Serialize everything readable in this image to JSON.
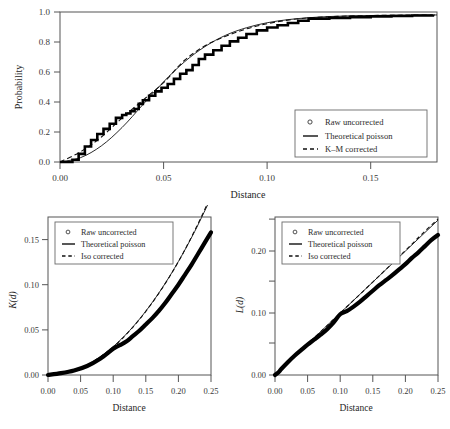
{
  "figure": {
    "background": "#ffffff",
    "ink": "#1a1a1a",
    "panel_border_color": "#555555"
  },
  "legend_common": {
    "raw_label": "Raw uncorrected",
    "theoretical_label": "Theoretical poisson",
    "km_label": "K–M corrected",
    "iso_label": "Iso corrected",
    "marker_raw": "circle-open-icon",
    "marker_theoretical": "solid-line-icon",
    "marker_corrected": "dashed-line-icon"
  },
  "panels": {
    "top": {
      "name": "empty-space-function-panel",
      "xlabel": "Distance",
      "ylabel": "Probability",
      "xticks": [
        "0.00",
        "0.05",
        "0.10",
        "0.15"
      ],
      "yticks": [
        "0.0",
        "0.2",
        "0.4",
        "0.6",
        "0.8",
        "1.0"
      ],
      "legend": [
        "Raw uncorrected",
        "Theoretical poisson",
        "K–M corrected"
      ]
    },
    "bottom_left": {
      "name": "ripley-k-panel",
      "xlabel": "Distance",
      "ylabel": "K(d)",
      "ylabel_fn": "K",
      "ylabel_arg": "d",
      "xticks": [
        "0.00",
        "0.05",
        "0.10",
        "0.15",
        "0.20",
        "0.25"
      ],
      "yticks": [
        "0.00",
        "0.05",
        "0.10",
        "0.15"
      ],
      "legend": [
        "Raw uncorrected",
        "Theoretical poisson",
        "Iso corrected"
      ]
    },
    "bottom_right": {
      "name": "besag-l-panel",
      "xlabel": "Distance",
      "ylabel": "L(d)",
      "ylabel_fn": "L",
      "ylabel_arg": "d",
      "xticks": [
        "0.00",
        "0.05",
        "0.10",
        "0.15",
        "0.20",
        "0.25"
      ],
      "yticks": [
        "0.00",
        "0.10",
        "0.20"
      ],
      "legend": [
        "Raw uncorrected",
        "Theoretical poisson",
        "Iso corrected"
      ]
    }
  },
  "chart_data": [
    {
      "type": "line",
      "id": "top-cdf",
      "title": "",
      "xlabel": "Distance",
      "ylabel": "Probability",
      "xlim": [
        0.0,
        0.182
      ],
      "ylim": [
        0.0,
        1.02
      ],
      "grid": false,
      "legend_position": "bottom-right",
      "xticks": [
        0.0,
        0.05,
        0.1,
        0.15
      ],
      "yticks": [
        0.0,
        0.2,
        0.4,
        0.6,
        0.8,
        1.0
      ],
      "series": [
        {
          "name": "Raw uncorrected",
          "style": "step",
          "x": [
            0.0,
            0.004,
            0.006,
            0.009,
            0.012,
            0.015,
            0.018,
            0.021,
            0.024,
            0.027,
            0.03,
            0.032,
            0.034,
            0.036,
            0.038,
            0.04,
            0.043,
            0.046,
            0.049,
            0.052,
            0.055,
            0.058,
            0.061,
            0.064,
            0.067,
            0.07,
            0.074,
            0.078,
            0.082,
            0.086,
            0.09,
            0.095,
            0.1,
            0.105,
            0.11,
            0.115,
            0.12,
            0.13,
            0.14,
            0.15,
            0.16,
            0.17,
            0.18
          ],
          "values": [
            0.0,
            0.0,
            0.015,
            0.055,
            0.105,
            0.15,
            0.19,
            0.225,
            0.26,
            0.3,
            0.32,
            0.33,
            0.345,
            0.36,
            0.395,
            0.42,
            0.45,
            0.48,
            0.505,
            0.53,
            0.565,
            0.6,
            0.625,
            0.66,
            0.7,
            0.73,
            0.76,
            0.79,
            0.82,
            0.845,
            0.87,
            0.895,
            0.915,
            0.93,
            0.945,
            0.96,
            0.975,
            0.98,
            0.985,
            0.99,
            0.993,
            0.996,
            1.0
          ]
        },
        {
          "name": "Theoretical poisson",
          "style": "solid",
          "x": [
            0.0,
            0.01,
            0.02,
            0.03,
            0.04,
            0.05,
            0.06,
            0.07,
            0.08,
            0.09,
            0.1,
            0.11,
            0.12,
            0.13,
            0.14,
            0.15,
            0.16,
            0.17,
            0.182
          ],
          "values": [
            0.0,
            0.03,
            0.11,
            0.235,
            0.39,
            0.545,
            0.68,
            0.785,
            0.862,
            0.913,
            0.947,
            0.968,
            0.981,
            0.989,
            0.994,
            0.996,
            0.998,
            0.999,
            1.0
          ]
        },
        {
          "name": "K–M corrected",
          "style": "dashed",
          "x": [
            0.0,
            0.01,
            0.02,
            0.03,
            0.04,
            0.05,
            0.06,
            0.07,
            0.08,
            0.09,
            0.1,
            0.11,
            0.12,
            0.13,
            0.14,
            0.15,
            0.16,
            0.17,
            0.182
          ],
          "values": [
            0.0,
            0.07,
            0.17,
            0.3,
            0.42,
            0.54,
            0.69,
            0.79,
            0.855,
            0.905,
            0.94,
            0.965,
            0.98,
            0.988,
            0.993,
            0.996,
            0.998,
            0.999,
            1.0
          ]
        }
      ]
    },
    {
      "type": "line",
      "id": "bottom-left-K",
      "title": "",
      "xlabel": "Distance",
      "ylabel": "K(d)",
      "xlim": [
        0.0,
        0.25
      ],
      "ylim": [
        0.0,
        0.175
      ],
      "grid": false,
      "legend_position": "top-left",
      "xticks": [
        0.0,
        0.05,
        0.1,
        0.15,
        0.2,
        0.25
      ],
      "yticks": [
        0.0,
        0.05,
        0.1,
        0.15
      ],
      "series": [
        {
          "name": "Raw uncorrected",
          "style": "thick",
          "x": [
            0.0,
            0.02,
            0.04,
            0.06,
            0.08,
            0.1,
            0.11,
            0.12,
            0.13,
            0.14,
            0.15,
            0.16,
            0.17,
            0.18,
            0.19,
            0.2,
            0.21,
            0.22,
            0.23,
            0.24,
            0.25
          ],
          "values": [
            0.0,
            0.002,
            0.005,
            0.01,
            0.018,
            0.029,
            0.033,
            0.037,
            0.043,
            0.049,
            0.056,
            0.063,
            0.071,
            0.08,
            0.09,
            0.1,
            0.111,
            0.122,
            0.134,
            0.146,
            0.158
          ]
        },
        {
          "name": "Theoretical poisson",
          "style": "solid",
          "x": [
            0.0,
            0.025,
            0.05,
            0.075,
            0.1,
            0.125,
            0.15,
            0.175,
            0.2,
            0.225,
            0.25
          ],
          "values": [
            0.0,
            0.002,
            0.0079,
            0.0177,
            0.0314,
            0.0491,
            0.0707,
            0.0962,
            0.1257,
            0.159,
            0.1963
          ]
        },
        {
          "name": "Iso corrected",
          "style": "dashed",
          "x": [
            0.0,
            0.025,
            0.05,
            0.075,
            0.1,
            0.125,
            0.15,
            0.175,
            0.2,
            0.225,
            0.25
          ],
          "values": [
            0.0,
            0.002,
            0.0078,
            0.0175,
            0.031,
            0.0488,
            0.0705,
            0.096,
            0.1255,
            0.16,
            0.198
          ]
        }
      ]
    },
    {
      "type": "line",
      "id": "bottom-right-L",
      "title": "",
      "xlabel": "Distance",
      "ylabel": "L(d)",
      "xlim": [
        0.0,
        0.25
      ],
      "ylim": [
        0.0,
        0.255
      ],
      "grid": false,
      "legend_position": "top-left",
      "xticks": [
        0.0,
        0.05,
        0.1,
        0.15,
        0.2,
        0.25
      ],
      "yticks": [
        0.0,
        0.1,
        0.2
      ],
      "series": [
        {
          "name": "Raw uncorrected",
          "style": "thick",
          "x": [
            0.0,
            0.005,
            0.01,
            0.02,
            0.03,
            0.04,
            0.05,
            0.06,
            0.07,
            0.08,
            0.09,
            0.1,
            0.11,
            0.12,
            0.13,
            0.14,
            0.15,
            0.16,
            0.17,
            0.18,
            0.19,
            0.2,
            0.21,
            0.22,
            0.23,
            0.24,
            0.25
          ],
          "values": [
            0.0,
            0.004,
            0.01,
            0.021,
            0.031,
            0.04,
            0.049,
            0.057,
            0.065,
            0.074,
            0.085,
            0.098,
            0.103,
            0.11,
            0.118,
            0.127,
            0.136,
            0.145,
            0.153,
            0.161,
            0.17,
            0.179,
            0.189,
            0.198,
            0.208,
            0.218,
            0.226
          ]
        },
        {
          "name": "Theoretical poisson",
          "style": "solid",
          "x": [
            0.0,
            0.05,
            0.1,
            0.15,
            0.2,
            0.25
          ],
          "values": [
            0.0,
            0.05,
            0.1,
            0.15,
            0.2,
            0.25
          ]
        },
        {
          "name": "Iso corrected",
          "style": "dashed",
          "x": [
            0.0,
            0.05,
            0.1,
            0.15,
            0.2,
            0.225,
            0.25
          ],
          "values": [
            0.0,
            0.05,
            0.1,
            0.15,
            0.201,
            0.227,
            0.252
          ]
        }
      ]
    }
  ]
}
